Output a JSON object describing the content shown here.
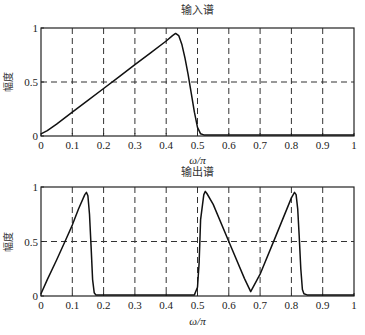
{
  "chart_data": [
    {
      "type": "line",
      "title": "输入谱",
      "xlabel": "ω/π",
      "ylabel": "幅度",
      "xlim": [
        0,
        1
      ],
      "ylim": [
        0,
        1
      ],
      "xticks": [
        "0",
        "0.1",
        "0.2",
        "0.3",
        "0.4",
        "0.5",
        "0.6",
        "0.7",
        "0.8",
        "0.9",
        "1"
      ],
      "yticks": [
        "0",
        "0.5",
        "1"
      ],
      "grid": true,
      "grid_style": "dashed",
      "series": [
        {
          "name": "输入谱",
          "x": [
            0,
            0.02,
            0.05,
            0.1,
            0.15,
            0.2,
            0.25,
            0.3,
            0.35,
            0.4,
            0.42,
            0.43,
            0.44,
            0.45,
            0.46,
            0.47,
            0.48,
            0.49,
            0.5,
            0.51,
            0.52,
            0.55,
            0.6,
            0.7,
            0.8,
            0.9,
            1.0
          ],
          "y": [
            0.02,
            0.05,
            0.11,
            0.22,
            0.33,
            0.44,
            0.55,
            0.66,
            0.77,
            0.88,
            0.93,
            0.95,
            0.93,
            0.85,
            0.72,
            0.57,
            0.4,
            0.22,
            0.08,
            0.02,
            0.01,
            0.01,
            0.01,
            0.01,
            0.01,
            0.01,
            0.01
          ]
        }
      ]
    },
    {
      "type": "line",
      "title": "输出谱",
      "xlabel": "ω/π",
      "ylabel": "幅度",
      "xlim": [
        0,
        1
      ],
      "ylim": [
        0,
        1
      ],
      "xticks": [
        "0",
        "0.1",
        "0.2",
        "0.3",
        "0.4",
        "0.5",
        "0.6",
        "0.7",
        "0.8",
        "0.9",
        "1"
      ],
      "yticks": [
        "0",
        "0.5",
        "1"
      ],
      "grid": true,
      "grid_style": "dashed",
      "series": [
        {
          "name": "输出谱",
          "x": [
            0,
            0.02,
            0.05,
            0.08,
            0.1,
            0.12,
            0.14,
            0.145,
            0.15,
            0.155,
            0.16,
            0.165,
            0.17,
            0.175,
            0.2,
            0.3,
            0.4,
            0.49,
            0.5,
            0.505,
            0.51,
            0.52,
            0.525,
            0.53,
            0.55,
            0.6,
            0.65,
            0.67,
            0.7,
            0.75,
            0.8,
            0.81,
            0.815,
            0.82,
            0.825,
            0.83,
            0.835,
            0.84,
            0.85,
            0.9,
            1.0
          ],
          "y": [
            0.02,
            0.15,
            0.33,
            0.52,
            0.65,
            0.8,
            0.93,
            0.95,
            0.92,
            0.75,
            0.45,
            0.15,
            0.03,
            0.01,
            0.01,
            0.01,
            0.01,
            0.01,
            0.08,
            0.3,
            0.7,
            0.93,
            0.96,
            0.94,
            0.84,
            0.5,
            0.16,
            0.04,
            0.2,
            0.55,
            0.9,
            0.95,
            0.93,
            0.8,
            0.55,
            0.25,
            0.06,
            0.02,
            0.01,
            0.01,
            0.01
          ]
        }
      ]
    }
  ]
}
